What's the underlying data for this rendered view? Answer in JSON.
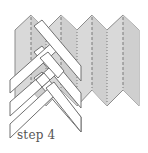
{
  "diagram": {
    "caption": "step 4",
    "colors": {
      "paper_fill": "#d9d9d9",
      "paper_stroke": "#8c8c8c",
      "strip_fill": "#ffffff",
      "strip_stroke": "#707070",
      "fold_line": "#7a7a7a",
      "caption_text": "#555555"
    },
    "fold_lines": [
      {
        "x": 31,
        "style": "dashed"
      },
      {
        "x": 46,
        "style": "dotted"
      },
      {
        "x": 61,
        "style": "dashed"
      },
      {
        "x": 77,
        "style": "dotted"
      },
      {
        "x": 92,
        "style": "dashed"
      },
      {
        "x": 107,
        "style": "dotted"
      },
      {
        "x": 123,
        "style": "dashed"
      }
    ],
    "strips": {
      "down_right_count": 3,
      "down_left_count": 3
    }
  }
}
